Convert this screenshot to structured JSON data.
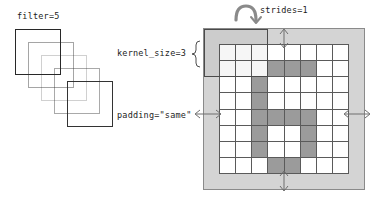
{
  "diagram": {
    "left_panel": {
      "label": "filter=5",
      "filter_count": 5,
      "squares": [
        {
          "x": 15,
          "y": 29,
          "opacity": 1.0
        },
        {
          "x": 28,
          "y": 42,
          "opacity": 0.42
        },
        {
          "x": 41,
          "y": 55,
          "opacity": 0.22
        },
        {
          "x": 54,
          "y": 68,
          "opacity": 0.4
        },
        {
          "x": 67,
          "y": 81,
          "opacity": 0.95
        }
      ]
    },
    "annotations": {
      "kernel_size": "kernel_size=3",
      "padding": "padding=\"same\"",
      "strides": "strides=1"
    },
    "grid": {
      "input_rows": 8,
      "input_cols": 8,
      "padding_cells": 1,
      "kernel_size": 3,
      "strides": 1,
      "padding_mode": "same",
      "active_cells": [
        [
          1,
          3
        ],
        [
          1,
          4
        ],
        [
          1,
          5
        ],
        [
          2,
          2
        ],
        [
          3,
          2
        ],
        [
          4,
          2
        ],
        [
          4,
          3
        ],
        [
          4,
          4
        ],
        [
          4,
          5
        ],
        [
          5,
          2
        ],
        [
          5,
          5
        ],
        [
          6,
          2
        ],
        [
          6,
          5
        ],
        [
          7,
          3
        ],
        [
          7,
          4
        ]
      ]
    },
    "colors": {
      "padding_fill": "#d4d4d4",
      "cell_on": "#9b9b9b",
      "cell_off": "#ffffff",
      "grid_line": "#5a5a5a",
      "outline": "#8a8a8a",
      "text": "#1c1c1c",
      "arrow": "#6e6e6e"
    }
  }
}
